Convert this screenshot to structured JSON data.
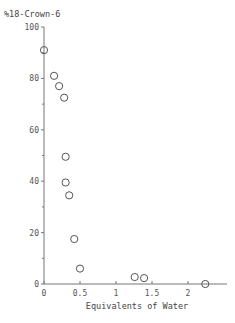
{
  "chart_data": {
    "type": "scatter",
    "title": "",
    "xlabel": "Equivalents of Water",
    "ylabel": "%18-Crown-6",
    "xlim": [
      0,
      2.5
    ],
    "ylim": [
      0,
      100
    ],
    "grid": false,
    "legend": null,
    "x_ticks": [
      0,
      0.5,
      1,
      1.5,
      2
    ],
    "x_tick_labels": [
      "0",
      "0.5",
      "1",
      "1.5",
      "2"
    ],
    "y_ticks": [
      0,
      20,
      40,
      60,
      80,
      100
    ],
    "y_tick_labels": [
      "0",
      "20",
      "40",
      "60",
      "80",
      "100"
    ],
    "y_minor_ticks": [
      10,
      30,
      50,
      70,
      90
    ],
    "series": [
      {
        "name": "%18-Crown-6",
        "marker": "open-circle",
        "points": [
          {
            "x": 0.0,
            "y": 91
          },
          {
            "x": 0.14,
            "y": 81
          },
          {
            "x": 0.21,
            "y": 77
          },
          {
            "x": 0.28,
            "y": 72.5
          },
          {
            "x": 0.3,
            "y": 49.5
          },
          {
            "x": 0.3,
            "y": 39.5
          },
          {
            "x": 0.35,
            "y": 34.5
          },
          {
            "x": 0.42,
            "y": 17.5
          },
          {
            "x": 0.5,
            "y": 6
          },
          {
            "x": 1.26,
            "y": 2.7
          },
          {
            "x": 1.39,
            "y": 2.3
          },
          {
            "x": 2.24,
            "y": 0
          }
        ]
      }
    ]
  },
  "labels": {
    "y_title": "%18-Crown-6",
    "x_title": "Equivalents of Water"
  }
}
